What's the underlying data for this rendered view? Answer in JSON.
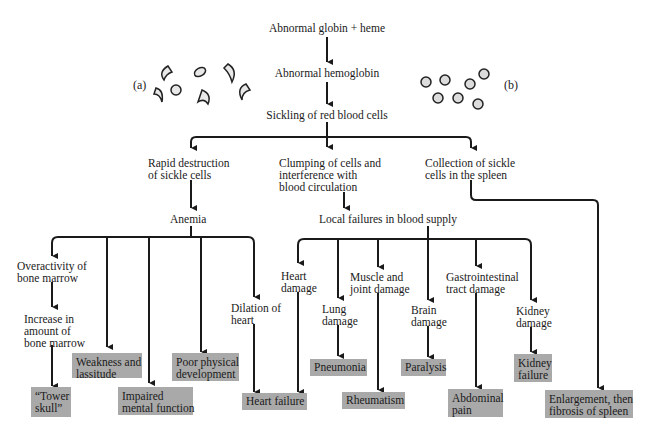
{
  "cells": {
    "label_a": "(a)",
    "label_b": "(b)"
  },
  "chain": {
    "n1": "Abnormal globin + heme",
    "n2": "Abnormal hemoglobin",
    "n3": "Sickling of red blood cells"
  },
  "branches": {
    "rapid": "Rapid destruction\nof sickle cells",
    "clumping": "Clumping of cells and\ninterference with\nblood circulation",
    "collection": "Collection of sickle\ncells in the spleen",
    "anemia": "Anemia",
    "local": "Local failures in blood supply"
  },
  "intermediate": {
    "overactivity": "Overactivity of\nbone marrow",
    "increase": "Increase in\namount of\nbone marrow",
    "dilation": "Dilation of\nheart",
    "heart_damage": "Heart\ndamage",
    "lung_damage": "Lung\ndamage",
    "muscle": "Muscle and\njoint damage",
    "brain": "Brain\ndamage",
    "gi": "Gastrointestinal\ntract damage",
    "kidney": "Kidney\ndamage"
  },
  "outcomes": {
    "tower": "“Tower\nskull”",
    "weakness": "Weakness and\nlassitude",
    "impaired": "Impaired\nmental function",
    "poor": "Poor physical\ndevelopment",
    "heart_failure": "Heart failure",
    "pneumonia": "Pneumonia",
    "rheumatism": "Rheumatism",
    "paralysis": "Paralysis",
    "abdominal": "Abdominal\npain",
    "kidney_failure": "Kidney\nfailure",
    "spleen": "Enlargement, then\nfibrosis of spleen"
  },
  "colors": {
    "outcome_box": "#a9a9a9",
    "line": "#1a1a1a"
  }
}
